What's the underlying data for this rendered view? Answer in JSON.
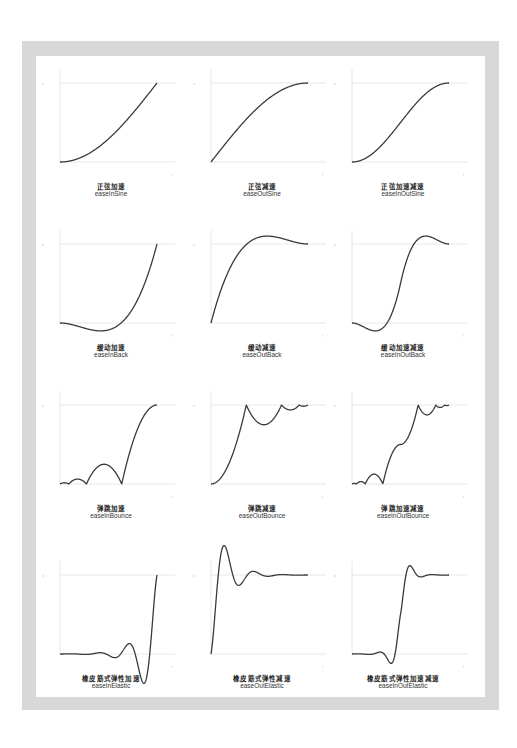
{
  "chart_data": [
    {
      "type": "line",
      "title_cn": "正弦加速",
      "title": "easeInSine",
      "xlabel": "t",
      "ylabel": "x",
      "ylim": [
        0,
        1
      ],
      "xlim": [
        0,
        1
      ],
      "grid": false,
      "fn": "easeInSine"
    },
    {
      "type": "line",
      "title_cn": "正弦减速",
      "title": "easeOutSine",
      "xlabel": "t",
      "ylabel": "x",
      "ylim": [
        0,
        1
      ],
      "xlim": [
        0,
        1
      ],
      "grid": false,
      "fn": "easeOutSine"
    },
    {
      "type": "line",
      "title_cn": "正弦加速减速",
      "title": "easeInOutSine",
      "xlabel": "t",
      "ylabel": "x",
      "ylim": [
        0,
        1
      ],
      "xlim": [
        0,
        1
      ],
      "grid": false,
      "fn": "easeInOutSine"
    },
    {
      "type": "line",
      "title_cn": "缓动加速",
      "title": "easeInBack",
      "xlabel": "t",
      "ylabel": "x",
      "ylim": [
        -0.1,
        1
      ],
      "xlim": [
        0,
        1
      ],
      "grid": false,
      "fn": "easeInBack"
    },
    {
      "type": "line",
      "title_cn": "缓动减速",
      "title": "easeOutBack",
      "xlabel": "t",
      "ylabel": "x",
      "ylim": [
        0,
        1.1
      ],
      "xlim": [
        0,
        1
      ],
      "grid": false,
      "fn": "easeOutBack"
    },
    {
      "type": "line",
      "title_cn": "缓动加速减速",
      "title": "easeInOutBack",
      "xlabel": "t",
      "ylabel": "x",
      "ylim": [
        -0.1,
        1.1
      ],
      "xlim": [
        0,
        1
      ],
      "grid": false,
      "fn": "easeInOutBack"
    },
    {
      "type": "line",
      "title_cn": "弹跳加速",
      "title": "easeInBounce",
      "xlabel": "t",
      "ylabel": "x",
      "ylim": [
        0,
        1
      ],
      "xlim": [
        0,
        1
      ],
      "grid": false,
      "fn": "easeInBounce"
    },
    {
      "type": "line",
      "title_cn": "弹跳减速",
      "title": "easeOutBounce",
      "xlabel": "t",
      "ylabel": "x",
      "ylim": [
        0,
        1
      ],
      "xlim": [
        0,
        1
      ],
      "grid": false,
      "fn": "easeOutBounce"
    },
    {
      "type": "line",
      "title_cn": "弹跳加速减速",
      "title": "easeInOutBounce",
      "xlabel": "t",
      "ylabel": "x",
      "ylim": [
        0,
        1
      ],
      "xlim": [
        0,
        1
      ],
      "grid": false,
      "fn": "easeInOutBounce"
    },
    {
      "type": "line",
      "title_cn": "橡皮筋式弹性加速",
      "title": "easeInElastic",
      "xlabel": "t",
      "ylabel": "x",
      "ylim": [
        -0.37,
        1
      ],
      "xlim": [
        0,
        1
      ],
      "grid": false,
      "fn": "easeInElastic"
    },
    {
      "type": "line",
      "title_cn": "橡皮筋式弹性减速",
      "title": "easeOutElastic",
      "xlabel": "t",
      "ylabel": "x",
      "ylim": [
        0,
        1.37
      ],
      "xlim": [
        0,
        1
      ],
      "grid": false,
      "fn": "easeOutElastic"
    },
    {
      "type": "line",
      "title_cn": "橡皮筋式弹性加速减速",
      "title": "easeInOutElastic",
      "xlabel": "t",
      "ylabel": "x",
      "ylim": [
        -0.12,
        1.12
      ],
      "xlim": [
        0,
        1
      ],
      "grid": false,
      "fn": "easeInOutElastic"
    }
  ],
  "axis_labels": {
    "x": "t",
    "y": "x"
  },
  "colors": {
    "frame": "#d8d8d8",
    "curve": "#3a3a3a",
    "axis": "#e2e2e2",
    "label": "#222222"
  }
}
